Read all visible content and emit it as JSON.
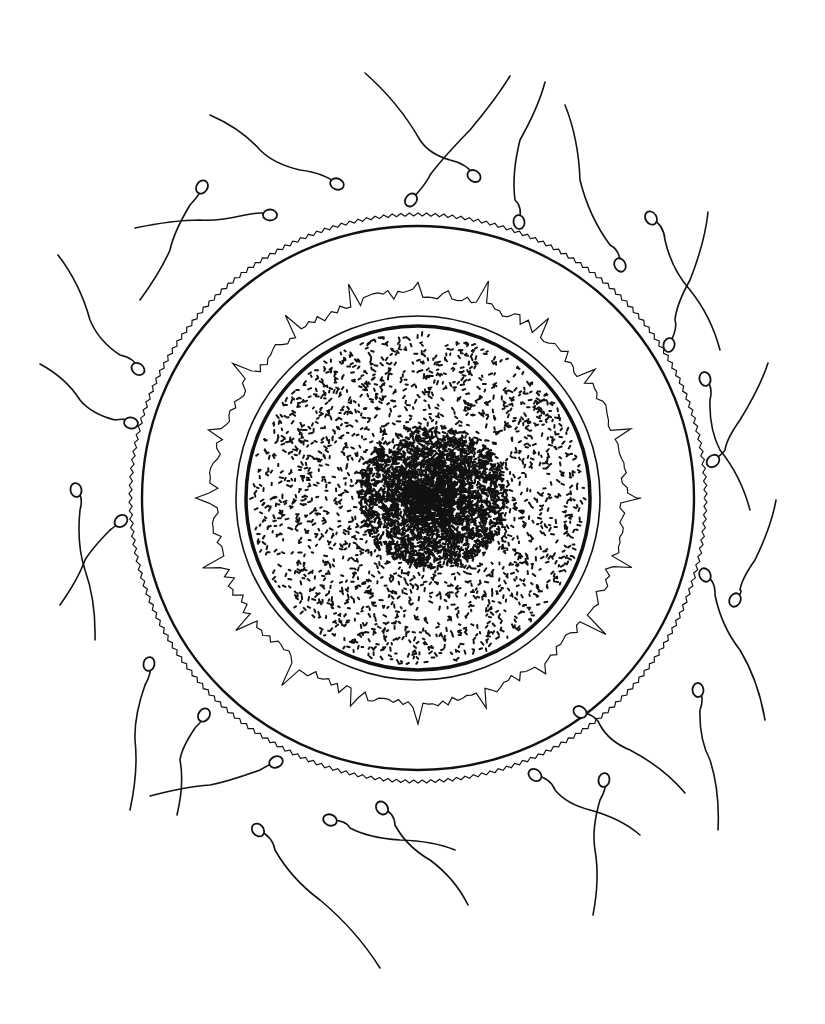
{
  "illustration": {
    "subject": "egg cell surrounded by sperm",
    "background": "#ffffff",
    "ink": "#111111",
    "egg": {
      "center": [
        418,
        498
      ],
      "outer_membrane": {
        "rx": 286,
        "ry": 282,
        "serrated": true
      },
      "zona_outer_ring": {
        "rx": 276,
        "ry": 272
      },
      "corona_jagged_layer": {
        "r": 205
      },
      "inner_ring": {
        "r": 182
      },
      "cytoplasm_border": {
        "r": 172
      },
      "nucleus": {
        "center": [
          432,
          496
        ],
        "r": 75
      }
    },
    "sperm": [
      {
        "head": [
          337,
          184
        ],
        "tail": [
          [
            210,
            115
          ],
          [
            260,
            150
          ],
          [
            300,
            170
          ]
        ]
      },
      {
        "head": [
          474,
          176
        ],
        "tail": [
          [
            365,
            73
          ],
          [
            420,
            140
          ],
          [
            450,
            160
          ]
        ]
      },
      {
        "head": [
          411,
          200
        ],
        "tail": [
          [
            510,
            76
          ],
          [
            470,
            130
          ],
          [
            430,
            175
          ]
        ]
      },
      {
        "head": [
          519,
          222
        ],
        "tail": [
          [
            545,
            82
          ],
          [
            520,
            140
          ],
          [
            515,
            200
          ]
        ]
      },
      {
        "head": [
          270,
          215
        ],
        "tail": [
          [
            135,
            228
          ],
          [
            200,
            220
          ],
          [
            245,
            215
          ]
        ]
      },
      {
        "head": [
          202,
          187
        ],
        "tail": [
          [
            140,
            300
          ],
          [
            170,
            250
          ],
          [
            190,
            205
          ]
        ]
      },
      {
        "head": [
          620,
          265
        ],
        "tail": [
          [
            565,
            105
          ],
          [
            580,
            180
          ],
          [
            610,
            245
          ]
        ]
      },
      {
        "head": [
          651,
          218
        ],
        "tail": [
          [
            720,
            350
          ],
          [
            690,
            290
          ],
          [
            665,
            240
          ]
        ]
      },
      {
        "head": [
          669,
          345
        ],
        "tail": [
          [
            708,
            212
          ],
          [
            690,
            280
          ],
          [
            675,
            320
          ]
        ]
      },
      {
        "head": [
          138,
          369
        ],
        "tail": [
          [
            58,
            255
          ],
          [
            90,
            320
          ],
          [
            120,
            355
          ]
        ]
      },
      {
        "head": [
          131,
          423
        ],
        "tail": [
          [
            40,
            364
          ],
          [
            80,
            400
          ],
          [
            115,
            420
          ]
        ]
      },
      {
        "head": [
          705,
          379
        ],
        "tail": [
          [
            750,
            510
          ],
          [
            720,
            450
          ],
          [
            710,
            400
          ]
        ]
      },
      {
        "head": [
          713,
          461
        ],
        "tail": [
          [
            768,
            363
          ],
          [
            740,
            420
          ],
          [
            725,
            450
          ]
        ]
      },
      {
        "head": [
          76,
          490
        ],
        "tail": [
          [
            95,
            640
          ],
          [
            85,
            570
          ],
          [
            80,
            510
          ]
        ]
      },
      {
        "head": [
          121,
          521
        ],
        "tail": [
          [
            60,
            605
          ],
          [
            85,
            560
          ],
          [
            110,
            530
          ]
        ]
      },
      {
        "head": [
          735,
          600
        ],
        "tail": [
          [
            776,
            500
          ],
          [
            755,
            560
          ],
          [
            740,
            590
          ]
        ]
      },
      {
        "head": [
          705,
          575
        ],
        "tail": [
          [
            765,
            720
          ],
          [
            740,
            650
          ],
          [
            715,
            595
          ]
        ]
      },
      {
        "head": [
          149,
          664
        ],
        "tail": [
          [
            130,
            810
          ],
          [
            135,
            740
          ],
          [
            145,
            685
          ]
        ]
      },
      {
        "head": [
          204,
          715
        ],
        "tail": [
          [
            177,
            815
          ],
          [
            180,
            760
          ],
          [
            195,
            728
          ]
        ]
      },
      {
        "head": [
          276,
          762
        ],
        "tail": [
          [
            150,
            796
          ],
          [
            210,
            785
          ],
          [
            260,
            770
          ]
        ]
      },
      {
        "head": [
          580,
          712
        ],
        "tail": [
          [
            685,
            793
          ],
          [
            630,
            750
          ],
          [
            600,
            725
          ]
        ]
      },
      {
        "head": [
          698,
          690
        ],
        "tail": [
          [
            718,
            830
          ],
          [
            710,
            760
          ],
          [
            700,
            710
          ]
        ]
      },
      {
        "head": [
          535,
          775
        ],
        "tail": [
          [
            640,
            835
          ],
          [
            590,
            810
          ],
          [
            555,
            790
          ]
        ]
      },
      {
        "head": [
          604,
          780
        ],
        "tail": [
          [
            593,
            915
          ],
          [
            595,
            850
          ],
          [
            600,
            800
          ]
        ]
      },
      {
        "head": [
          382,
          808
        ],
        "tail": [
          [
            468,
            905
          ],
          [
            430,
            860
          ],
          [
            395,
            825
          ]
        ]
      },
      {
        "head": [
          330,
          820
        ],
        "tail": [
          [
            455,
            850
          ],
          [
            400,
            840
          ],
          [
            350,
            828
          ]
        ]
      },
      {
        "head": [
          258,
          830
        ],
        "tail": [
          [
            380,
            968
          ],
          [
            320,
            900
          ],
          [
            275,
            850
          ]
        ]
      }
    ]
  }
}
